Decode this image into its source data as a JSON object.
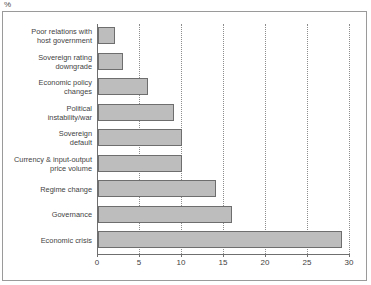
{
  "unit_label": "%",
  "chart_data": {
    "type": "bar",
    "orientation": "horizontal",
    "title": "",
    "subtitle": "",
    "xlabel": "",
    "ylabel": "",
    "unit": "%",
    "xlim": [
      0,
      30
    ],
    "xticks": [
      0,
      5,
      10,
      15,
      20,
      25,
      30
    ],
    "xtick_labels": [
      "0",
      "5",
      "10",
      "15",
      "20",
      "25",
      "30"
    ],
    "grid": "vertical-dotted",
    "legend": "none",
    "bar_color": "#bdbdbd",
    "bar_edge_color": "#6e6e6e",
    "categories": [
      "Poor relations with host government",
      "Sovereign rating downgrade",
      "Economic policy changes",
      "Political instability/war",
      "Sovereign default",
      "Currency & input-output price volume",
      "Regime change",
      "Governance",
      "Economic crisis"
    ],
    "values": [
      2,
      3,
      6,
      9,
      10,
      10,
      14,
      16,
      29
    ]
  },
  "rows": [
    {
      "label_lines": [
        "Poor relations with",
        "host government"
      ],
      "value": 2
    },
    {
      "label_lines": [
        "Sovereign rating",
        "downgrade"
      ],
      "value": 3
    },
    {
      "label_lines": [
        "Economic policy",
        "changes"
      ],
      "value": 6
    },
    {
      "label_lines": [
        "Political",
        "instability/war"
      ],
      "value": 9
    },
    {
      "label_lines": [
        "Sovereign",
        "default"
      ],
      "value": 10
    },
    {
      "label_lines": [
        "Currency & input-output",
        "price volume"
      ],
      "value": 10
    },
    {
      "label_lines": [
        "Regime change"
      ],
      "value": 14
    },
    {
      "label_lines": [
        "Governance"
      ],
      "value": 16
    },
    {
      "label_lines": [
        "Economic crisis"
      ],
      "value": 29
    }
  ]
}
